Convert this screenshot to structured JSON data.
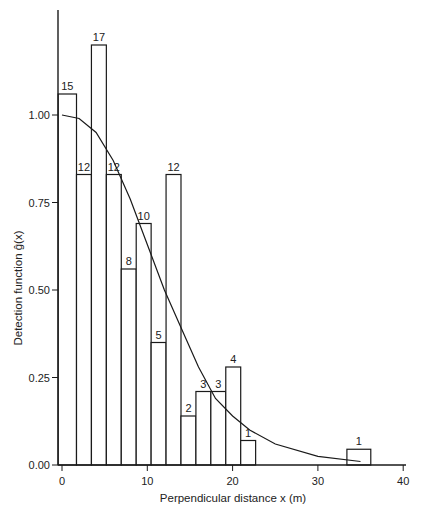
{
  "chart_data": {
    "type": "bar",
    "subtype": "histogram-with-fitted-curve",
    "title": "",
    "xlabel": "Perpendicular distance x (m)",
    "ylabel": "Detection function ĝ(x)",
    "xlim": [
      0,
      40
    ],
    "ylim": [
      0,
      1.25
    ],
    "x_ticks": [
      0,
      10,
      20,
      30,
      40
    ],
    "x_tick_labels": [
      "0",
      "10",
      "20",
      "30",
      "40"
    ],
    "y_ticks": [
      0.0,
      0.25,
      0.5,
      0.75,
      1.0
    ],
    "y_tick_labels": [
      "0.00",
      "0.25",
      "0.50",
      "0.75",
      "1.00"
    ],
    "grid": false,
    "legend": null,
    "bins": [
      {
        "x_start": -0.45,
        "x_end": 1.7,
        "count": 15,
        "height": 1.06
      },
      {
        "x_start": 1.7,
        "x_end": 3.45,
        "count": 12,
        "height": 0.83
      },
      {
        "x_start": 3.45,
        "x_end": 5.2,
        "count": 17,
        "height": 1.2
      },
      {
        "x_start": 5.2,
        "x_end": 6.95,
        "count": 12,
        "height": 0.83
      },
      {
        "x_start": 6.95,
        "x_end": 8.7,
        "count": 8,
        "height": 0.56
      },
      {
        "x_start": 8.7,
        "x_end": 10.45,
        "count": 10,
        "height": 0.69
      },
      {
        "x_start": 10.45,
        "x_end": 12.2,
        "count": 5,
        "height": 0.35
      },
      {
        "x_start": 12.2,
        "x_end": 13.95,
        "count": 12,
        "height": 0.83
      },
      {
        "x_start": 13.95,
        "x_end": 15.7,
        "count": 2,
        "height": 0.14
      },
      {
        "x_start": 15.7,
        "x_end": 17.45,
        "count": 3,
        "height": 0.21
      },
      {
        "x_start": 17.45,
        "x_end": 19.2,
        "count": 3,
        "height": 0.21
      },
      {
        "x_start": 19.2,
        "x_end": 20.95,
        "count": 4,
        "height": 0.28
      },
      {
        "x_start": 20.95,
        "x_end": 22.7,
        "count": 1,
        "height": 0.07
      },
      {
        "x_start": 33.4,
        "x_end": 36.2,
        "count": 1,
        "height": 0.045
      }
    ],
    "categories": [
      "bin1",
      "bin2",
      "bin3",
      "bin4",
      "bin5",
      "bin6",
      "bin7",
      "bin8",
      "bin9",
      "bin10",
      "bin11",
      "bin12",
      "bin13",
      "bin14"
    ],
    "values": [
      15,
      12,
      17,
      12,
      8,
      10,
      5,
      12,
      2,
      3,
      3,
      4,
      1,
      1
    ],
    "curve": {
      "name": "fitted detection function",
      "x": [
        0,
        2,
        4,
        6,
        8,
        10,
        12,
        14,
        16,
        18,
        20,
        22,
        25,
        30,
        35
      ],
      "y": [
        1.0,
        0.99,
        0.95,
        0.87,
        0.76,
        0.63,
        0.5,
        0.39,
        0.28,
        0.19,
        0.14,
        0.1,
        0.06,
        0.025,
        0.01
      ]
    }
  }
}
